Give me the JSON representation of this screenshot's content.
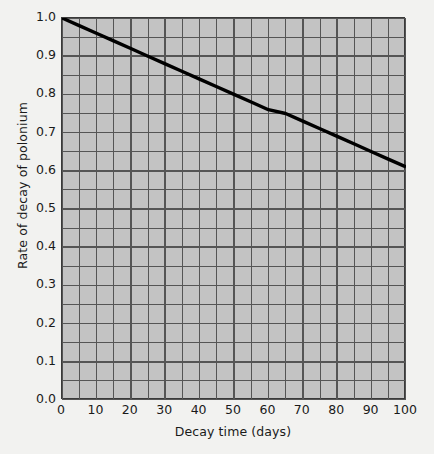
{
  "chart_data": {
    "type": "line",
    "title": "",
    "xlabel": "Decay time (days)",
    "ylabel": "Rate of decay of polonium",
    "xlim": [
      0,
      100
    ],
    "ylim": [
      0.0,
      1.0
    ],
    "x_ticks": [
      0,
      10,
      20,
      30,
      40,
      50,
      60,
      70,
      80,
      90,
      100
    ],
    "x_tick_labels": [
      "0",
      "10",
      "20",
      "30",
      "40",
      "50",
      "60",
      "70",
      "80",
      "90",
      "100"
    ],
    "y_ticks": [
      0.0,
      0.1,
      0.2,
      0.3,
      0.4,
      0.5,
      0.6,
      0.7,
      0.8,
      0.9,
      1.0
    ],
    "y_tick_labels": [
      "0.0",
      "0.1",
      "0.2",
      "0.3",
      "0.4",
      "0.5",
      "0.6",
      "0.7",
      "0.8",
      "0.9",
      "1.0"
    ],
    "x_minor_step": 5,
    "y_minor_step": 0.05,
    "grid": true,
    "grid_color": "#555555",
    "plot_background": "#c3c3c3",
    "figure_background": "#f2f2f0",
    "legend": null,
    "series": [
      {
        "name": "Rate of decay of polonium",
        "color": "#000000",
        "line_width": 3.4,
        "x": [
          0,
          5,
          10,
          15,
          20,
          25,
          30,
          35,
          40,
          45,
          50,
          55,
          60,
          65,
          70,
          75,
          80,
          85,
          90,
          95,
          100
        ],
        "values": [
          1.0,
          0.98,
          0.96,
          0.94,
          0.92,
          0.9,
          0.88,
          0.86,
          0.84,
          0.82,
          0.8,
          0.78,
          0.76,
          0.75,
          0.73,
          0.71,
          0.69,
          0.67,
          0.65,
          0.63,
          0.61
        ]
      }
    ],
    "annotations": []
  }
}
